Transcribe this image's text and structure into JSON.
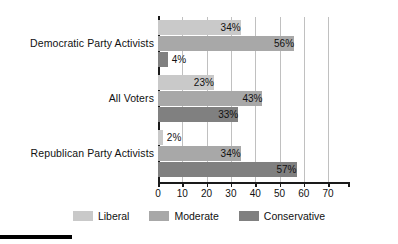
{
  "chart_data": {
    "type": "bar",
    "orientation": "horizontal",
    "title": "",
    "subtitle": "",
    "xlabel": "",
    "ylabel": "",
    "xlim": [
      0,
      70
    ],
    "xticks": [
      0,
      10,
      20,
      30,
      40,
      50,
      60,
      70
    ],
    "xtick_labels": [
      "0",
      "10",
      "20",
      "30",
      "40",
      "50",
      "60",
      "70"
    ],
    "grid": true,
    "grid_axis": "x",
    "legend_position": "bottom",
    "value_suffix": "%",
    "categories": [
      "Democratic Party Activists",
      "All Voters",
      "Republican Party Activists"
    ],
    "series": [
      {
        "name": "Liberal",
        "color": "#c9c9c9",
        "values": [
          34,
          23,
          2
        ],
        "labels": [
          "34%",
          "23%",
          "2%"
        ]
      },
      {
        "name": "Moderate",
        "color": "#a8a8a8",
        "values": [
          56,
          43,
          34
        ],
        "labels": [
          "56%",
          "43%",
          "34%"
        ]
      },
      {
        "name": "Conservative",
        "color": "#808080",
        "values": [
          4,
          33,
          57
        ],
        "labels": [
          "4%",
          "33%",
          "57%"
        ]
      }
    ]
  },
  "axis": {
    "line_color": "#1a1a1a",
    "grid_color": "#c0c0c0"
  },
  "legend": {
    "items": [
      {
        "label": "Liberal",
        "color": "#c9c9c9"
      },
      {
        "label": "Moderate",
        "color": "#a8a8a8"
      },
      {
        "label": "Conservative",
        "color": "#808080"
      }
    ]
  },
  "decoration": {
    "bottom_rule_color": "#000000"
  }
}
